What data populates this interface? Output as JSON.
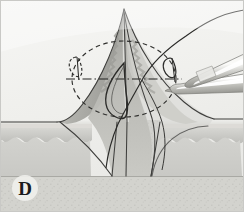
{
  "figure": {
    "panel_label": "D",
    "width": 244,
    "height": 212
  },
  "colors": {
    "background": "#f2f2f0",
    "border": "#c9c9c6",
    "skin_surface_light": "#e6e6e3",
    "skin_surface_mid": "#dcdcd8",
    "dermis_upper": "#d4d4d0",
    "dermis_mid": "#c2c2be",
    "dermis_lower": "#b4b4b0",
    "subcutaneous": "#cfcfcb",
    "flap_light": "#d7d7d3",
    "flap_mid": "#bdbdb8",
    "flap_dark": "#a3a39e",
    "flap_darkest": "#8f8f8a",
    "stipple": "#c6c6c1",
    "instrument_light": "#ffffff",
    "instrument_mid": "#d0d0cc",
    "instrument_dark": "#9a9a95",
    "outline": "#3a3a38",
    "suture": "#262624",
    "label_text": "#1b1b1b"
  },
  "elements": {
    "cone_flap": "cone-shaped elevated tissue flap",
    "flap_apex": "pointed apex of elevated flap",
    "left_suture_loop": "small suture loop at left flap edge",
    "right_suture_loop": "small suture loop at right flap edge",
    "center_suture_loop": "central teardrop suture loop",
    "dashed_ellipse": "dashed elliptical outline of the base",
    "center_axis_line": "dash-dot horizontal center axis",
    "forceps": "surgical forceps entering from upper right",
    "forceps_upper_jaw": "upper jaw of forceps",
    "forceps_lower_jaw": "lower jaw of forceps",
    "suture_thread": "long suture thread crossing the field",
    "skin_surface": "horizontal skin surface plane",
    "epidermis_band": "epidermis band",
    "dermis_band": "dermis band with scalloped lower border",
    "subcutaneous_layer": "subcutaneous fat layer with stipple texture",
    "wedge_defect": "stippled central wedge defect"
  }
}
